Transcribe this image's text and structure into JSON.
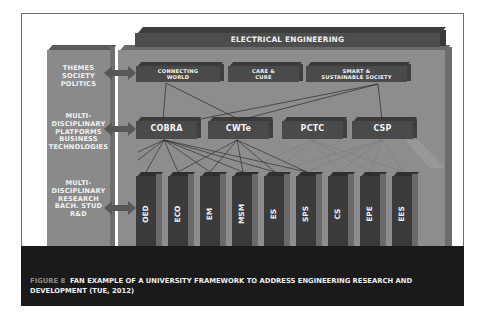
{
  "figure": {
    "top_bar": {
      "label": "ELECTRICAL ENGINEERING"
    },
    "left_labels": [
      {
        "lines": [
          "THEMES",
          "SOCIETY",
          "POLITICS"
        ]
      },
      {
        "lines": [
          "MULTI-",
          "DISCIPLINARY",
          "PLATFORMS",
          "BUSINESS",
          "TECHNOLOGIES"
        ]
      },
      {
        "lines": [
          "MULTI-",
          "DISCIPLINARY",
          "RESEARCH",
          "BACH. STUD",
          "R&D"
        ]
      }
    ],
    "themes": [
      {
        "lines": [
          "CONNECTING",
          "WORLD"
        ]
      },
      {
        "lines": [
          "CARE &",
          "CURE"
        ]
      },
      {
        "lines": [
          "SMART &",
          "SUSTAINABLE SOCIETY"
        ]
      }
    ],
    "platforms": [
      "COBRA",
      "CWTe",
      "PCTC",
      "CSP"
    ],
    "research_groups": [
      "OED",
      "ECO",
      "EM",
      "MSM",
      "ES",
      "SPS",
      "CS",
      "EPE",
      "EES"
    ],
    "colors": {
      "panel": "#8d8d8d",
      "box": "#4a4a4a",
      "caption_bg": "#1a1a1a",
      "caption_label": "#8a8a8a"
    }
  },
  "caption": {
    "figure_label": "FIGURE 8",
    "text": "FAN EXAMPLE OF A UNIVERSITY FRAMEWORK TO ADDRESS ENGINEERING RESEARCH AND DEVELOPMENT (TUE, 2012)"
  }
}
